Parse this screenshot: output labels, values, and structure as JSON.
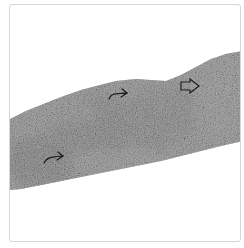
{
  "figure": {
    "type": "grayscale histology micrograph",
    "background_color": "#ffffff",
    "border_color": "#d6d6d6",
    "tissue": {
      "description": "diagonal band of tissue crossing frame from lower-left to upper-right",
      "dark_tone": "#5a5a5a",
      "mid_tone": "#9a9a9a",
      "light_tone": "#d0d0d0"
    },
    "annotations": [
      {
        "kind": "arrow",
        "direction": "right",
        "style": "curved-line",
        "x": 108,
        "y": 92
      },
      {
        "kind": "arrow",
        "direction": "right",
        "style": "hollow",
        "x": 180,
        "y": 84
      },
      {
        "kind": "arrow",
        "direction": "right",
        "style": "curved-line",
        "x": 43,
        "y": 157
      }
    ]
  }
}
